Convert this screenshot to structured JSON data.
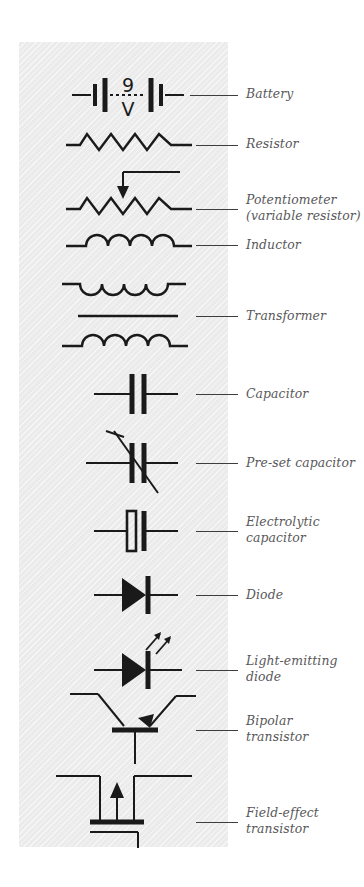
{
  "figure": {
    "kind": "electronic-component-symbols-legend",
    "panel_color": "#ebebeb",
    "line_color": "#1a1a1a",
    "label_color": "#58585a"
  },
  "battery_annotation": {
    "value": "9",
    "unit": "V"
  },
  "rows": [
    {
      "id": "battery",
      "label": "Battery",
      "symbol": "battery-symbol"
    },
    {
      "id": "resistor",
      "label": "Resistor",
      "symbol": "resistor-symbol"
    },
    {
      "id": "potentiometer",
      "label": "Potentiometer\n(variable resistor)",
      "symbol": "potentiometer-symbol"
    },
    {
      "id": "inductor",
      "label": "Inductor",
      "symbol": "inductor-symbol"
    },
    {
      "id": "transformer",
      "label": "Transformer",
      "symbol": "transformer-symbol"
    },
    {
      "id": "capacitor",
      "label": "Capacitor",
      "symbol": "capacitor-symbol"
    },
    {
      "id": "preset-capacitor",
      "label": "Pre-set capacitor",
      "symbol": "preset-capacitor-symbol"
    },
    {
      "id": "electrolytic",
      "label": "Electrolytic\ncapacitor",
      "symbol": "electrolytic-capacitor-symbol"
    },
    {
      "id": "diode",
      "label": "Diode",
      "symbol": "diode-symbol"
    },
    {
      "id": "led",
      "label": "Light-emitting\ndiode",
      "symbol": "led-symbol"
    },
    {
      "id": "bipolar-transistor",
      "label": "Bipolar\ntransistor",
      "symbol": "bipolar-transistor-symbol"
    },
    {
      "id": "fet",
      "label": "Field-effect\ntransistor",
      "symbol": "field-effect-transistor-symbol"
    }
  ]
}
